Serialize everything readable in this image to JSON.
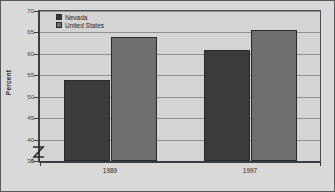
{
  "chart_data": {
    "type": "bar",
    "title": "",
    "xlabel": "",
    "ylabel": "Percent",
    "categories": [
      "1989",
      "1997"
    ],
    "series": [
      {
        "name": "Nevada",
        "values": [
          54,
          61
        ],
        "color": "#3b3b3b"
      },
      {
        "name": "United States",
        "values": [
          64,
          65.5
        ],
        "color": "#6e6e6e"
      }
    ],
    "ylim": [
      35,
      70
    ],
    "yticks": [
      "70",
      "65",
      "60",
      "55",
      "50",
      "45",
      "40",
      "35",
      "0"
    ],
    "ytick_values": [
      70,
      65,
      60,
      55,
      50,
      45,
      40,
      35,
      0
    ],
    "gridlines": true,
    "axis_break": true,
    "axis_break_symbol": "Z",
    "legend_position": "top-left",
    "legend": [
      "Nevada",
      "United States"
    ]
  },
  "colors": {
    "series_nevada": "#3b3b3b",
    "series_united_states": "#6e6e6e",
    "plot_background": "#d4d4d4",
    "page_background": "#d9d9d9",
    "gridline": "#8d9094",
    "axis": "#3a3d41",
    "border": "#55585c"
  },
  "axis": {
    "y_title": "Percent"
  }
}
